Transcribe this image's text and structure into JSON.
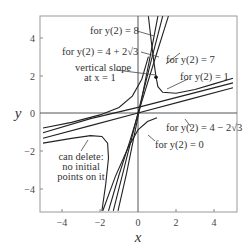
{
  "chart_data": {
    "type": "line",
    "title": "",
    "xlabel": "x",
    "ylabel": "y",
    "xlim": [
      -5.2,
      5.2
    ],
    "ylim": [
      -5.3,
      5.2
    ],
    "grid": false,
    "xticks": [
      -4,
      -2,
      0,
      2,
      4
    ],
    "yticks": [
      -4,
      -2,
      0,
      2,
      4
    ],
    "series": [
      {
        "name": "y(2) = 8",
        "points": [
          [
            -1.05,
            -5.2
          ],
          [
            -0.6,
            -3.2
          ],
          [
            -0.2,
            -1.2
          ],
          [
            0.2,
            0.8
          ],
          [
            0.6,
            2.8
          ],
          [
            1.0,
            4.9
          ],
          [
            1.05,
            5.15
          ]
        ]
      },
      {
        "name": "y(2) = 4 + 2√3",
        "points": [
          [
            -1.3,
            -5.2
          ],
          [
            -0.65,
            -2.6
          ],
          [
            0,
            0
          ],
          [
            0.65,
            2.6
          ],
          [
            1.3,
            5.15
          ]
        ]
      },
      {
        "name": "y(2) = 7",
        "points": [
          [
            -1.55,
            -5.2
          ],
          [
            -1.0,
            -3.3
          ],
          [
            -0.4,
            -1.4
          ],
          [
            0.2,
            0.6
          ],
          [
            0.9,
            2.9
          ],
          [
            1.6,
            5.15
          ]
        ]
      },
      {
        "name": "y(2) = 1",
        "points": [
          [
            0.55,
            5.15
          ],
          [
            0.7,
            3.8
          ],
          [
            0.85,
            2.6
          ],
          [
            0.95,
            1.9
          ],
          [
            1.05,
            1.4
          ],
          [
            1.3,
            1.1
          ],
          [
            2.0,
            1.05
          ],
          [
            3.0,
            1.25
          ],
          [
            4.0,
            1.55
          ],
          [
            5.0,
            1.85
          ]
        ]
      },
      {
        "name": "y(2) = 4 − 2√3",
        "points": [
          [
            -5.0,
            -1.34
          ],
          [
            -2.5,
            -0.67
          ],
          [
            0,
            0
          ],
          [
            2.5,
            0.67
          ],
          [
            5.0,
            1.34
          ]
        ]
      },
      {
        "name": "shallow-upper",
        "points": [
          [
            -5.0,
            -1.05
          ],
          [
            -2.5,
            -0.3
          ],
          [
            0,
            0.3
          ],
          [
            2.5,
            0.95
          ],
          [
            5.0,
            1.6
          ]
        ]
      },
      {
        "name": "y(2) = 0",
        "points": [
          [
            -1.85,
            -5.2
          ],
          [
            -1.2,
            -3.4
          ],
          [
            -0.5,
            -1.8
          ],
          [
            0,
            -0.9
          ],
          [
            0.5,
            -0.45
          ],
          [
            1.0,
            -0.25
          ]
        ]
      },
      {
        "name": "upper-left branch",
        "points": [
          [
            -5.0,
            -0.8
          ],
          [
            -3.5,
            -0.5
          ],
          [
            -2.0,
            -0.1
          ],
          [
            -1.0,
            0.3
          ],
          [
            -0.3,
            0.9
          ],
          [
            0.2,
            1.8
          ],
          [
            0.55,
            3.0
          ]
        ]
      },
      {
        "name": "can delete",
        "points": [
          [
            -5.0,
            -1.6
          ],
          [
            -3.5,
            -1.35
          ],
          [
            -2.5,
            -1.2
          ],
          [
            -1.9,
            -1.25
          ],
          [
            -1.6,
            -1.6
          ],
          [
            -1.55,
            -2.4
          ],
          [
            -1.7,
            -3.8
          ],
          [
            -1.9,
            -5.2
          ]
        ]
      }
    ],
    "annotations": [
      {
        "text": "for y(2) = 8",
        "x": -0.2,
        "y": 4.3
      },
      {
        "text": "for y(2) = 4 + 2√3",
        "x": -0.2,
        "y": 3.1
      },
      {
        "text": "vertical slope",
        "x": -1.6,
        "y": 2.0
      },
      {
        "text": "at x = 1",
        "x": -1.6,
        "y": 1.4
      },
      {
        "text": "for y(2) = 7",
        "x": 2.0,
        "y": 3.0
      },
      {
        "text": "for y(2) = 1",
        "x": 2.5,
        "y": 1.9
      },
      {
        "text": "for y(2) = 4 − 2√3",
        "x": 2.0,
        "y": -0.9
      },
      {
        "text": "for y(2) = 0",
        "x": 0.8,
        "y": -1.6
      },
      {
        "text": "can delete:",
        "x": -4.0,
        "y": -1.7
      },
      {
        "text": "no initial",
        "x": -4.0,
        "y": -2.2
      },
      {
        "text": "points on it",
        "x": -4.0,
        "y": -2.7
      }
    ],
    "marked_point": {
      "x": 0.95,
      "y": 1.9,
      "note": "vertical slope at x = 1"
    }
  },
  "labels": {
    "xaxis": "x",
    "yaxis": "y",
    "l8": "for y(2) = 8",
    "l4p": "for y(2) = 4 + 2",
    "l4p_root": "√3",
    "vs1": "vertical slope",
    "vs2": "at x = 1",
    "l7": "for y(2) = 7",
    "l1": "for y(2) = 1",
    "l4m": "for y(2) = 4 − 2",
    "l4m_root": "√3",
    "l0": "for y(2) = 0",
    "cd1": "can delete:",
    "cd2": "no initial",
    "cd3": "points on it",
    "t_xm4": "−4",
    "t_xm2": "−2",
    "t_x0": "0",
    "t_x2": "2",
    "t_x4": "4",
    "t_y4": "4",
    "t_y2": "2",
    "t_y0": "0",
    "t_ym2": "−2",
    "t_ym4": "−4"
  }
}
